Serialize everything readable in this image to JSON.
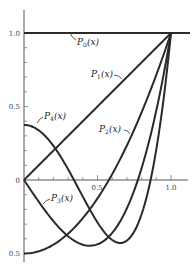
{
  "chart_data": {
    "type": "line",
    "title": "",
    "xlabel": "",
    "ylabel": "",
    "xlim": [
      0,
      1.0
    ],
    "ylim": [
      -0.5,
      1.0
    ],
    "grid": false,
    "legend": "inline labels",
    "x_ticks": [
      0.1,
      0.2,
      0.3,
      0.4,
      0.5,
      0.6,
      0.7,
      0.8,
      0.9,
      1.0
    ],
    "x_tick_labels": {
      "0.5": "0.5",
      "1.0": "1.0"
    },
    "y_tick_labels": [
      {
        "value": 1.0,
        "label": "1.0"
      },
      {
        "value": 0.5,
        "label": "0.5"
      },
      {
        "value": 0.0,
        "label": "0"
      },
      {
        "value": -0.5,
        "label": "0.5"
      }
    ],
    "x_axis_zero_label": "0",
    "series": [
      {
        "name": "P0(x)",
        "label_main": "P",
        "label_sub": "0",
        "label_arg": "(x)",
        "formula": "1",
        "x": [
          0,
          0.25,
          0.5,
          0.75,
          1.0
        ],
        "values": [
          1,
          1,
          1,
          1,
          1
        ]
      },
      {
        "name": "P1(x)",
        "label_main": "P",
        "label_sub": "1",
        "label_arg": "(x)",
        "formula": "x",
        "x": [
          0,
          0.25,
          0.5,
          0.75,
          1.0
        ],
        "values": [
          0,
          0.25,
          0.5,
          0.75,
          1.0
        ]
      },
      {
        "name": "P2(x)",
        "label_main": "P",
        "label_sub": "2",
        "label_arg": "(x)",
        "formula": "(3x^2-1)/2",
        "x": [
          0,
          0.25,
          0.5,
          0.577,
          0.75,
          1.0
        ],
        "values": [
          -0.5,
          -0.406,
          -0.125,
          0,
          0.344,
          1.0
        ]
      },
      {
        "name": "P3(x)",
        "label_main": "P",
        "label_sub": "3",
        "label_arg": "(x)",
        "formula": "(5x^3-3x)/2",
        "x": [
          0,
          0.25,
          0.447,
          0.5,
          0.775,
          1.0
        ],
        "values": [
          0,
          -0.336,
          -0.447,
          -0.4375,
          0,
          1.0
        ]
      },
      {
        "name": "P4(x)",
        "label_main": "P",
        "label_sub": "4",
        "label_arg": "(x)",
        "formula": "(35x^4-30x^2+3)/8",
        "x": [
          0,
          0.25,
          0.34,
          0.5,
          0.655,
          0.861,
          1.0
        ],
        "values": [
          0.375,
          0.1035,
          0,
          -0.289,
          -0.4286,
          0,
          1.0
        ]
      }
    ]
  },
  "labels": {
    "y_1": "1.0",
    "y_05": "0.5",
    "y_0": "0",
    "y_m05": "0.5",
    "x_05": "0.5",
    "x_1": "1.0",
    "p": "P",
    "arg": "(x)",
    "sub0": "0",
    "sub1": "1",
    "sub2": "2",
    "sub3": "3",
    "sub4": "4"
  }
}
